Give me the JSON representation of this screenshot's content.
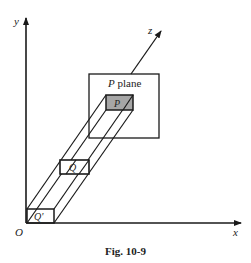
{
  "figure": {
    "caption": "Fig. 10-9",
    "axes": {
      "x_label": "x",
      "y_label": "y",
      "z_label": "z",
      "origin_label": "O"
    },
    "plane": {
      "label_italic": "P",
      "label_rest": " plane"
    },
    "points": {
      "p": "P",
      "q": "Q",
      "q_prime": "Q'"
    },
    "colors": {
      "stroke": "#1a1a1a",
      "shade": "#a6a6a6",
      "background": "#ffffff"
    }
  }
}
